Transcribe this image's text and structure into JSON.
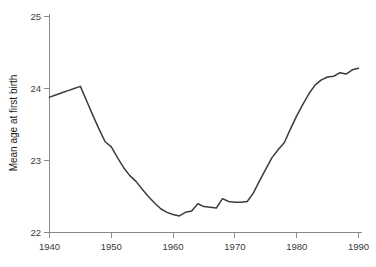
{
  "chart_data": {
    "type": "line",
    "title": "",
    "subtitle": "",
    "xlabel": "",
    "ylabel": "Mean age at first birth",
    "xlim": [
      1940,
      1990
    ],
    "ylim": [
      22,
      25
    ],
    "grid": false,
    "legend": null,
    "xticks": [
      1940,
      1950,
      1960,
      1970,
      1980,
      1990
    ],
    "xtick_labels": [
      "1940",
      "1950",
      "1960",
      "1970",
      "1980",
      "1990"
    ],
    "yticks": [
      22,
      23,
      24,
      25
    ],
    "ytick_labels": [
      "22",
      "23",
      "24",
      "25"
    ],
    "series": [
      {
        "name": "Mean age at first birth",
        "color": "#3c3c3c",
        "x": [
          1940,
          1941,
          1942,
          1943,
          1944,
          1945,
          1946,
          1947,
          1948,
          1949,
          1950,
          1951,
          1952,
          1953,
          1954,
          1955,
          1956,
          1957,
          1958,
          1959,
          1960,
          1961,
          1962,
          1963,
          1964,
          1965,
          1966,
          1967,
          1968,
          1969,
          1970,
          1971,
          1972,
          1973,
          1974,
          1975,
          1976,
          1977,
          1978,
          1979,
          1980,
          1981,
          1982,
          1983,
          1984,
          1985,
          1986,
          1987,
          1988,
          1989,
          1990
        ],
        "values": [
          23.88,
          23.91,
          23.94,
          23.97,
          24.0,
          24.03,
          23.83,
          23.63,
          23.44,
          23.26,
          23.19,
          23.04,
          22.9,
          22.79,
          22.71,
          22.6,
          22.5,
          22.41,
          22.33,
          22.28,
          22.25,
          22.23,
          22.28,
          22.3,
          22.4,
          22.36,
          22.35,
          22.34,
          22.47,
          22.43,
          22.42,
          22.42,
          22.43,
          22.55,
          22.72,
          22.88,
          23.04,
          23.15,
          23.25,
          23.44,
          23.62,
          23.78,
          23.93,
          24.05,
          24.12,
          24.16,
          24.17,
          24.22,
          24.2,
          24.26,
          24.28
        ]
      }
    ]
  },
  "axes": {
    "y_axis_title": "Mean age at first birth",
    "x_axis_title": ""
  },
  "colors": {
    "line": "#3c3c3c",
    "axis": "#8a8a8a",
    "tick_label": "#3a3a3a",
    "background": "#ffffff"
  }
}
